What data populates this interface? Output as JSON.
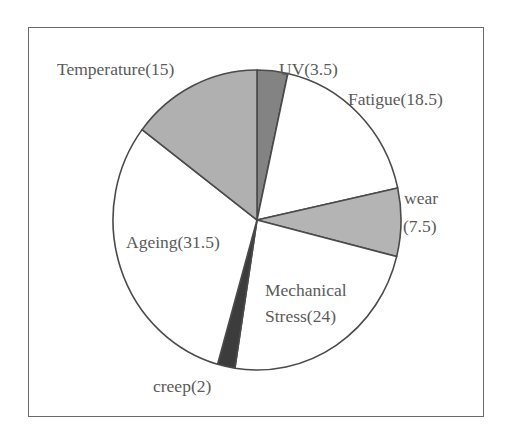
{
  "chart_data": {
    "type": "pie",
    "title": "",
    "start_angle_deg": -90,
    "direction": "clockwise",
    "center": [
      257,
      220
    ],
    "radius": [
      144,
      150
    ],
    "slices": [
      {
        "name": "UV",
        "value": 3.5,
        "label": "UV(3.5)",
        "color": "#838383"
      },
      {
        "name": "Fatigue",
        "value": 18.5,
        "label": "Fatigue(18.5)",
        "color": "#ffffff"
      },
      {
        "name": "wear",
        "value": 7.5,
        "label": "wear (7.5)",
        "color": "#b4b4b4"
      },
      {
        "name": "Mechanical Stress",
        "value": 24,
        "label": "Mechanical Stress(24)",
        "color": "#ffffff"
      },
      {
        "name": "creep",
        "value": 2,
        "label": "creep(2)",
        "color": "#3c3c3c"
      },
      {
        "name": "Ageing",
        "value": 31.5,
        "label": "Ageing(31.5)",
        "color": "#ffffff"
      },
      {
        "name": "Temperature",
        "value": 15,
        "label": "Temperature(15)",
        "color": "#b0b0b0"
      }
    ],
    "legend": "none (inline labels)",
    "stroke_color": "#4a4a4a"
  },
  "labels": {
    "temperature": "Temperature(15)",
    "uv": "UV(3.5)",
    "fatigue": "Fatigue(18.5)",
    "wear_line1": "wear",
    "wear_line2": "(7.5)",
    "ageing": "Ageing(31.5)",
    "mechanical_line1": "Mechanical",
    "mechanical_line2": "Stress(24)",
    "creep": "creep(2)"
  }
}
